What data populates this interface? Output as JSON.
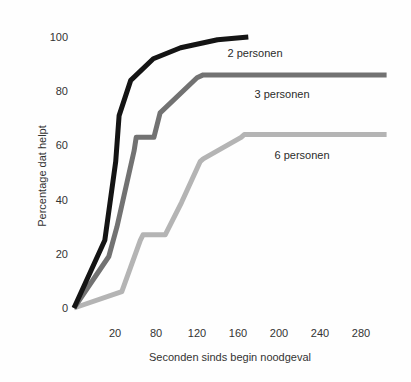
{
  "chart_data": {
    "type": "line",
    "title": "",
    "xlabel": "Seconden sinds begin noodgeval",
    "ylabel": "Percentage dat helpt",
    "x_unit": "seconden",
    "y_unit": "percent",
    "x_tick_labels": [
      20,
      80,
      120,
      160,
      200,
      240,
      280
    ],
    "y_tick_labels": [
      0,
      20,
      40,
      60,
      80,
      100
    ],
    "ylim": [
      0,
      100
    ],
    "grid": "off",
    "legend_position": "inline labels to the right/below each line",
    "x_axis_note": "tick labels printed at even spacing although intervals differ (20,80,120,...)",
    "series": [
      {
        "name": "2 personen",
        "color": "#141414",
        "points": [
          [
            0,
            0
          ],
          [
            15,
            25
          ],
          [
            21,
            54
          ],
          [
            26,
            71
          ],
          [
            43,
            84
          ],
          [
            76,
            92
          ],
          [
            104,
            96
          ],
          [
            140,
            99
          ],
          [
            170,
            100
          ]
        ]
      },
      {
        "name": "3 personen",
        "color": "#727272",
        "points": [
          [
            0,
            0
          ],
          [
            17,
            19
          ],
          [
            23,
            30
          ],
          [
            48,
            58
          ],
          [
            51,
            63
          ],
          [
            77,
            63
          ],
          [
            84,
            72
          ],
          [
            120,
            85
          ],
          [
            126,
            86
          ],
          [
            305,
            86
          ]
        ]
      },
      {
        "name": "6 personen",
        "color": "#b4b4b4",
        "points": [
          [
            0,
            0
          ],
          [
            30,
            6
          ],
          [
            57,
            25
          ],
          [
            61,
            27
          ],
          [
            89,
            27
          ],
          [
            105,
            39
          ],
          [
            123,
            54
          ],
          [
            126,
            55
          ],
          [
            163,
            63
          ],
          [
            166,
            64
          ],
          [
            305,
            64
          ]
        ]
      }
    ]
  }
}
